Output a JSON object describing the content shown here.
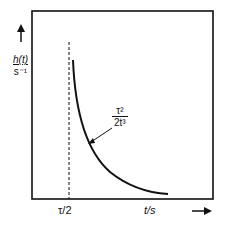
{
  "diagram": {
    "y_axis": {
      "label_numerator": "h(t)",
      "label_denominator": "s⁻¹",
      "arrow_direction": "up"
    },
    "x_axis": {
      "label": "t/s",
      "tick_label": "τ/2",
      "arrow_direction": "right"
    },
    "curve_annotation": {
      "numerator": "τ²",
      "denominator": "2t³"
    },
    "elements": [
      "frame-box",
      "dashed-vertical-line-at-tau-half",
      "decaying-curve",
      "annotation-arrow"
    ]
  }
}
